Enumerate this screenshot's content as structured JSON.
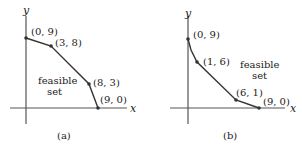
{
  "figures": [
    {
      "id": "a",
      "caption": "(a)",
      "region_label": [
        "feasible",
        "set"
      ],
      "axis_x_label": "x",
      "axis_y_label": "y",
      "points": [
        {
          "label": "(0, 9)",
          "x": 0,
          "y": 9
        },
        {
          "label": "(3, 8)",
          "x": 3,
          "y": 8
        },
        {
          "label": "(8, 3)",
          "x": 8,
          "y": 3
        },
        {
          "label": "(9, 0)",
          "x": 9,
          "y": 0
        }
      ]
    },
    {
      "id": "b",
      "caption": "(b)",
      "region_label": [
        "feasible",
        "set"
      ],
      "axis_x_label": "x",
      "axis_y_label": "y",
      "points": [
        {
          "label": "(0, 9)",
          "x": 0,
          "y": 9
        },
        {
          "label": "(1, 6)",
          "x": 1,
          "y": 6
        },
        {
          "label": "(6, 1)",
          "x": 6,
          "y": 1
        },
        {
          "label": "(9, 0)",
          "x": 9,
          "y": 0
        }
      ]
    }
  ],
  "colors": {
    "line": "#333333",
    "point": "#333333",
    "axis": "#555555"
  }
}
